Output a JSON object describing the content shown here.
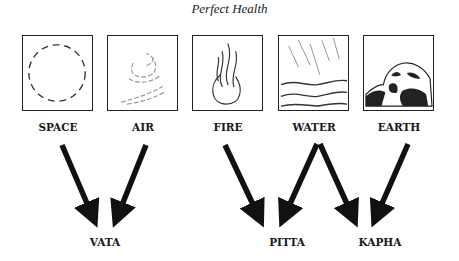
{
  "title": "Perfect Health",
  "elements": [
    {
      "label": "SPACE",
      "icon": "dashed-circle-icon"
    },
    {
      "label": "AIR",
      "icon": "wind-swirl-icon"
    },
    {
      "label": "FIRE",
      "icon": "flame-icon"
    },
    {
      "label": "WATER",
      "icon": "rain-waves-icon"
    },
    {
      "label": "EARTH",
      "icon": "rock-icon"
    }
  ],
  "doshas": [
    {
      "label": "VATA",
      "from": [
        "SPACE",
        "AIR"
      ]
    },
    {
      "label": "PITTA",
      "from": [
        "FIRE",
        "WATER"
      ]
    },
    {
      "label": "KAPHA",
      "from": [
        "WATER",
        "EARTH"
      ]
    }
  ]
}
